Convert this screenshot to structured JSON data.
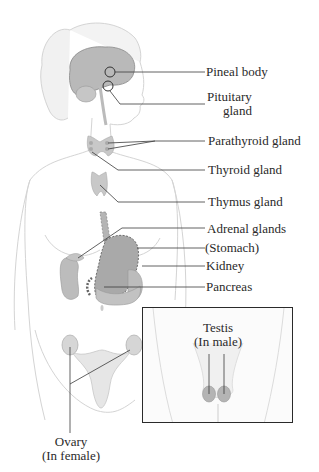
{
  "diagram": {
    "labels": {
      "pineal": "Pineal body",
      "pituitary_line1": "Pituitary",
      "pituitary_line2": "gland",
      "parathyroid": "Parathyroid gland",
      "thyroid": "Thyroid gland",
      "thymus": "Thymus gland",
      "adrenal": "Adrenal glands",
      "stomach": "(Stomach)",
      "kidney": "Kidney",
      "pancreas": "Pancreas",
      "testis_line1": "Testis",
      "testis_line2": "(In male)",
      "ovary_line1": "Ovary",
      "ovary_line2": "(In female)"
    },
    "colors": {
      "outline": "#c8c8c8",
      "organ_fill": "#bdbdbd",
      "organ_dark": "#9a9a9a",
      "leader_line": "#3a3a3a",
      "text": "#2a2a2a",
      "inset_border": "#2a2a2a"
    }
  }
}
